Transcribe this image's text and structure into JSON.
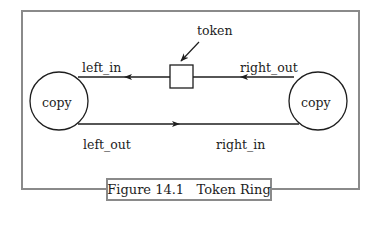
{
  "figure": {
    "caption": "Figure 14.1   Token Ring",
    "labels": {
      "token": "token",
      "left_in": "left_in",
      "right_out": "right_out",
      "left_out": "left_out",
      "right_in": "right_in"
    },
    "nodes": {
      "left": "copy",
      "right": "copy"
    },
    "colors": {
      "frame": "#8a8a8a",
      "stroke": "#1e1e1e"
    }
  }
}
